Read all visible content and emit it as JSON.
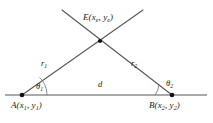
{
  "diagram": {
    "colors": {
      "baseline": "#8c8c8c",
      "ray": "#595959",
      "arc": "#7a7a7a",
      "vertex_dot": "#111111",
      "label_text": "#1a1a1a",
      "background": "#ffffff"
    },
    "points": [
      {
        "id": "E",
        "name": "intersection-point-e",
        "label_main": "E",
        "coord_open": "(",
        "coord_x": "x",
        "coord_x_sub": "e",
        "coord_sep": ", ",
        "coord_y": "y",
        "coord_y_sub": "e",
        "coord_close": ")",
        "cx": 100,
        "cy": 41
      },
      {
        "id": "A",
        "name": "vertex-point-a",
        "label_main": "A",
        "coord_open": "(",
        "coord_x": "x",
        "coord_x_sub": "1",
        "coord_sep": ", ",
        "coord_y": "y",
        "coord_y_sub": "1",
        "coord_close": ")",
        "cx": 22,
        "cy": 95
      },
      {
        "id": "B",
        "name": "vertex-point-b",
        "label_main": "B",
        "coord_open": "(",
        "coord_x": "x",
        "coord_x_sub": "2",
        "coord_sep": ", ",
        "coord_y": "y",
        "coord_y_sub": "2",
        "coord_close": ")",
        "cx": 172,
        "cy": 95
      }
    ],
    "segments": [
      {
        "id": "r1",
        "name": "ray-from-a",
        "label": "r",
        "label_sub": "1",
        "x1": 22,
        "y1": 95,
        "x2": 143,
        "y2": 10
      },
      {
        "id": "r2",
        "name": "ray-from-b",
        "label": "r",
        "label_sub": "2",
        "x1": 172,
        "y1": 95,
        "x2": 62,
        "y2": 10
      },
      {
        "id": "d",
        "name": "baseline-segment",
        "label": "d",
        "label_sub": "",
        "x1": 5,
        "y1": 95,
        "x2": 207,
        "y2": 95
      }
    ],
    "angles": [
      {
        "id": "theta1",
        "name": "angle-theta-1",
        "label": "θ",
        "label_sub": "1",
        "at_point": "A"
      },
      {
        "id": "theta2",
        "name": "angle-theta-2",
        "label": "θ",
        "label_sub": "2",
        "at_point": "B"
      }
    ]
  }
}
